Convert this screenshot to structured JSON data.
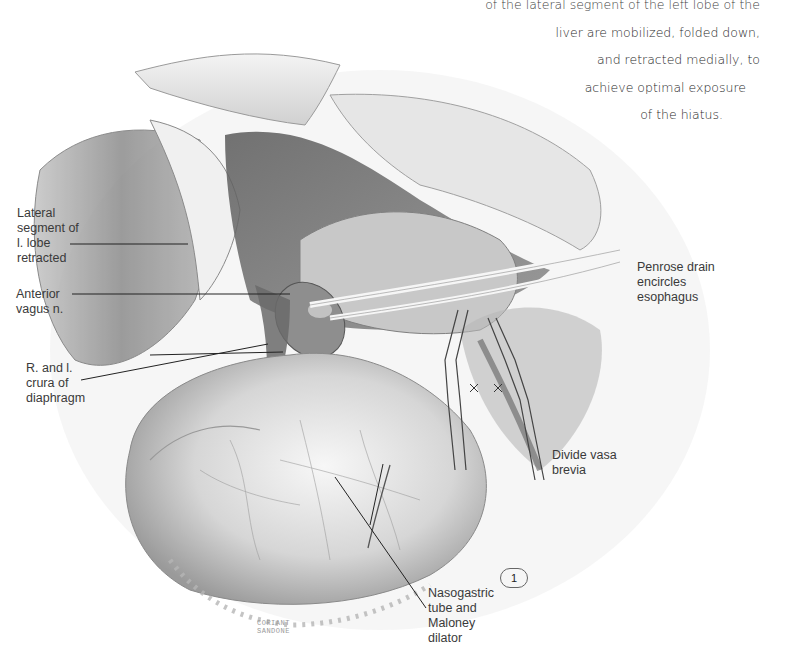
{
  "caption": {
    "lines": [
      "of the lateral segment of the left lobe of the",
      "liver are mobilized, folded down,",
      "and retracted medially, to",
      "achieve optimal exposure",
      "of the hiatus."
    ]
  },
  "labels": {
    "lateral_segment": [
      "Lateral",
      "segment of",
      "l. lobe",
      "retracted"
    ],
    "anterior_vagus": [
      "Anterior",
      "vagus n."
    ],
    "crura": [
      "R. and l.",
      "crura of",
      "diaphragm"
    ],
    "penrose": [
      "Penrose drain",
      "encircles",
      "esophagus"
    ],
    "vasa_brevia": [
      "Divide vasa",
      "brevia"
    ],
    "nasogastric": [
      "Nasogastric",
      "tube and",
      "Maloney",
      "dilator"
    ]
  },
  "figure_number": "1",
  "signature": [
    "CORIANT",
    "SANDONE"
  ],
  "colors": {
    "text": "#3a3a3a",
    "leader": "#222222",
    "tissue_dark": "#6e6e6e",
    "tissue_mid": "#a8a8a8",
    "tissue_light": "#e2e2e2"
  }
}
